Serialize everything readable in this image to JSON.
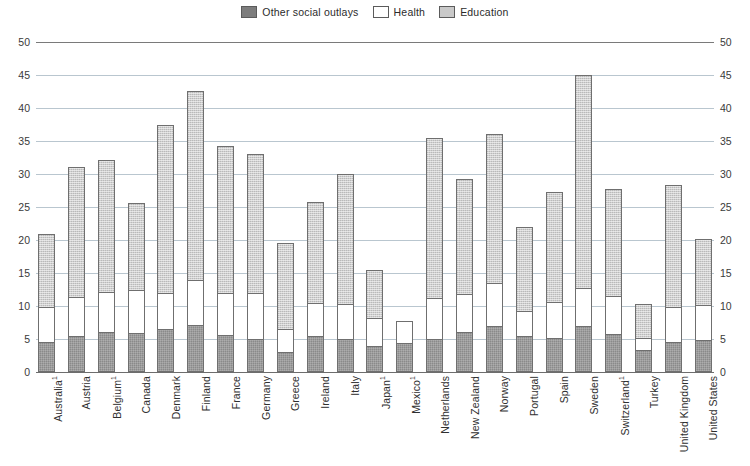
{
  "legend": {
    "position": "top-center",
    "items": [
      {
        "label": "Other social outlays",
        "key": "other",
        "color": "#8a8a8a"
      },
      {
        "label": "Health",
        "key": "health",
        "color": "#ffffff"
      },
      {
        "label": "Education",
        "key": "education",
        "color": "#cfcfcf"
      }
    ]
  },
  "axis": {
    "y_ticks": [
      "0",
      "5",
      "10",
      "15",
      "20",
      "25",
      "30",
      "35",
      "40",
      "45",
      "50"
    ],
    "y_min": 0,
    "y_max": 50,
    "y_step": 5,
    "grid": true,
    "right_axis_mirrored": true
  },
  "footnote_marker": "1",
  "chart_data": {
    "type": "bar",
    "title": "",
    "subtitle": "",
    "xlabel": "",
    "ylabel": "",
    "ylim": [
      0,
      50
    ],
    "grid": true,
    "stacked": true,
    "legend_position": "top-center",
    "categories": [
      "Australia¹",
      "Austria",
      "Belgium¹",
      "Canada",
      "Denmark",
      "Finland",
      "France",
      "Germany",
      "Greece",
      "Ireland",
      "Italy",
      "Japan¹",
      "Mexico¹",
      "Netherlands",
      "New Zealand",
      "Norway",
      "Portugal",
      "Spain",
      "Sweden",
      "Switzerland¹",
      "Turkey",
      "United Kingdom",
      "United States"
    ],
    "series": [
      {
        "name": "Other social outlays",
        "values": [
          4.5,
          5.5,
          6.0,
          5.9,
          6.5,
          7.1,
          5.6,
          5.0,
          3.0,
          5.5,
          5.0,
          4.0,
          4.4,
          5.0,
          6.1,
          6.9,
          5.4,
          5.2,
          7.0,
          5.7,
          3.4,
          4.6,
          4.9
        ]
      },
      {
        "name": "Health",
        "values": [
          5.4,
          5.8,
          6.2,
          6.6,
          5.5,
          6.9,
          6.4,
          7.0,
          3.5,
          5.0,
          5.3,
          4.2,
          3.4,
          6.2,
          5.7,
          6.6,
          3.9,
          5.4,
          5.8,
          5.8,
          1.8,
          5.3,
          5.2
        ]
      },
      {
        "name": "Education",
        "values": [
          11.0,
          19.7,
          20.0,
          13.1,
          25.4,
          28.6,
          22.3,
          21.0,
          13.0,
          15.3,
          19.7,
          7.3,
          0.0,
          24.3,
          17.5,
          22.5,
          12.7,
          16.7,
          32.2,
          16.3,
          5.1,
          18.4,
          10.1
        ]
      }
    ],
    "totals": [
      20.9,
      31.0,
      32.2,
      25.6,
      37.4,
      42.6,
      34.3,
      33.0,
      19.5,
      25.8,
      30.0,
      15.5,
      7.8,
      35.5,
      29.3,
      36.0,
      22.0,
      27.3,
      45.0,
      27.8,
      10.3,
      28.3,
      20.2
    ]
  }
}
